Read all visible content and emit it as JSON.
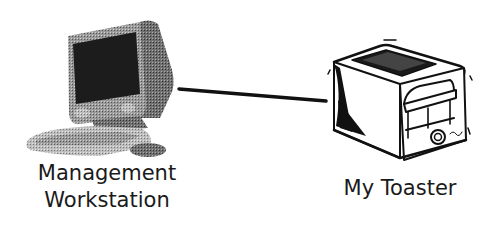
{
  "diagram": {
    "type": "network-connection",
    "nodes": [
      {
        "id": "workstation",
        "icon": "desktop-computer-icon",
        "label_lines": [
          "Management",
          "Workstation"
        ]
      },
      {
        "id": "toaster",
        "icon": "toaster-icon",
        "label_lines": [
          "My Toaster"
        ]
      }
    ],
    "edges": [
      {
        "from": "workstation",
        "to": "toaster",
        "style": "solid"
      }
    ],
    "colors": {
      "background": "#ffffff",
      "line": "#111111",
      "text": "#1a1a1a",
      "screen": "#1c1c1c",
      "casing": "#8c8c8c"
    }
  }
}
